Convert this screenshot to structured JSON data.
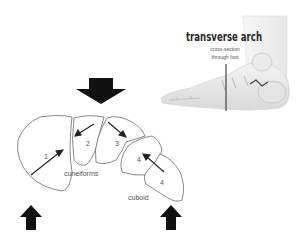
{
  "figure": {
    "title": "transverse arch",
    "subtitle_line1": "cross-section",
    "subtitle_line2": "through foot",
    "illustration": "foot-lateral-view",
    "bones": [
      {
        "label": "1",
        "name": "medial-cuneiform"
      },
      {
        "label": "2",
        "name": "intermediate-cuneiform"
      },
      {
        "label": "3",
        "name": "lateral-cuneiform"
      },
      {
        "label": "4",
        "name": "cuboid-upper"
      },
      {
        "label": "4",
        "name": "cuboid-lower"
      }
    ],
    "group_labels": {
      "cuneiforms": "cuneiforms",
      "cuboid": "cuboid"
    },
    "force_arrows": [
      {
        "direction": "down",
        "position": "top-center"
      },
      {
        "direction": "up",
        "position": "bottom-left"
      },
      {
        "direction": "up",
        "position": "bottom-right"
      }
    ],
    "colors": {
      "background": "#ffffff",
      "outline": "#6b6b6b",
      "arrow": "#111111",
      "text": "#555555",
      "title": "#2a2a2a"
    }
  }
}
